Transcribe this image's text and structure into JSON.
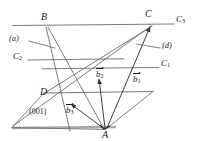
{
  "figure": {
    "background_color": "#ffffff",
    "line_color": "#555555",
    "thick_line_color": "#9a9a9a",
    "text_color": "#1a1a1a",
    "width": 205,
    "height": 141
  },
  "vertices": [
    {
      "id": "B",
      "label": "B",
      "x": 45,
      "y": 19
    },
    {
      "id": "C",
      "label": "C",
      "x": 148,
      "y": 17
    },
    {
      "id": "D",
      "label": "D",
      "x": 44,
      "y": 93
    },
    {
      "id": "A",
      "label": "A",
      "x": 105,
      "y": 133
    }
  ],
  "plane_labels": [
    {
      "id": "C3",
      "letter": "C",
      "sub": "3",
      "x": 178,
      "y": 19
    },
    {
      "id": "C1",
      "letter": "C",
      "sub": "1",
      "x": 163,
      "y": 65
    },
    {
      "id": "C2",
      "letter": "C",
      "sub": "2",
      "x": 15,
      "y": 58
    }
  ],
  "direction_labels": [
    {
      "id": "a",
      "label": "(a)",
      "x": 11,
      "y": 39
    },
    {
      "id": "d",
      "label": "(d)",
      "x": 163,
      "y": 46
    }
  ],
  "miller_index": {
    "label": "(001)",
    "x": 31,
    "y": 113
  },
  "vectors": [
    {
      "id": "b1",
      "letter": "b",
      "sub": "1",
      "x": 135,
      "y": 79,
      "from": "A",
      "to": "C"
    },
    {
      "id": "b2",
      "letter": "b",
      "sub": "2",
      "x": 98,
      "y": 74,
      "from": "A",
      "to": "B"
    },
    {
      "id": "b3",
      "letter": "b",
      "sub": "3",
      "x": 70,
      "y": 110,
      "from": "A",
      "to": "D"
    }
  ],
  "lines": {
    "C3_plane": {
      "x1": 13,
      "y1": 26,
      "x2": 175,
      "y2": 24
    },
    "C2_line": {
      "x1": 28,
      "y1": 60,
      "x2": 124,
      "y2": 58
    },
    "C1_line": {
      "x1": 42,
      "y1": 69,
      "x2": 160,
      "y2": 67
    },
    "D_line": {
      "x1": 44,
      "y1": 93,
      "x2": 153,
      "y2": 91
    },
    "base_line": {
      "x1": 12,
      "y1": 128,
      "x2": 115,
      "y2": 127
    }
  },
  "edges": [
    {
      "from": "B",
      "to": "A",
      "desc": "B to A edge"
    },
    {
      "from": "B",
      "to": "D",
      "desc": "B down-left toward D region"
    },
    {
      "from": "C",
      "to": "A",
      "desc": "C to A edge"
    },
    {
      "from": "D",
      "to": "C",
      "desc": "D to C edge"
    },
    {
      "from": "D",
      "to": "A",
      "desc": "D to A edge"
    }
  ]
}
